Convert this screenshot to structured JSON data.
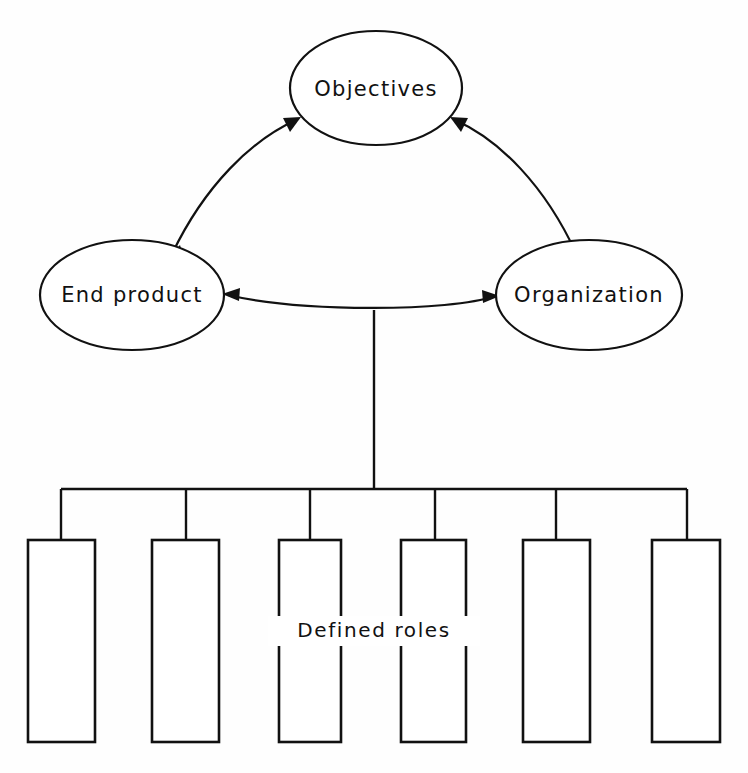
{
  "figure": {
    "caption": "",
    "background_color": "#fefefe",
    "line_color": "#111111"
  },
  "nodes": [
    {
      "id": "objectives",
      "label": "Objectives",
      "shape": "ellipse",
      "cx": 376,
      "cy": 88,
      "rx": 86,
      "ry": 57
    },
    {
      "id": "end-product",
      "label": "End product",
      "shape": "ellipse",
      "cx": 132,
      "cy": 295,
      "rx": 92,
      "ry": 55
    },
    {
      "id": "organization",
      "label": "Organization",
      "shape": "ellipse",
      "cx": 589,
      "cy": 295,
      "rx": 93,
      "ry": 55
    }
  ],
  "connectors": [
    {
      "id": "end-product-objectives",
      "from": "end product",
      "to": "objectives",
      "style": "curved",
      "arrowheads": "both"
    },
    {
      "id": "objectives-organization",
      "from": "objectives",
      "to": "organization",
      "style": "curved",
      "arrowheads": "both"
    },
    {
      "id": "end-product-organization",
      "from": "end product",
      "to": "organization",
      "style": "curved",
      "arrowheads": "both"
    },
    {
      "id": "stem",
      "from": "end-product-organization link",
      "to": "roles bar",
      "style": "straight",
      "arrowheads": "none"
    }
  ],
  "roles": {
    "label": "Defined   roles",
    "count": 6,
    "boxes": [
      {
        "index": 1,
        "x": 28,
        "y": 540,
        "width": 67,
        "height": 202
      },
      {
        "index": 2,
        "x": 152,
        "y": 540,
        "width": 67,
        "height": 202
      },
      {
        "index": 3,
        "x": 279,
        "y": 540,
        "width": 62,
        "height": 202
      },
      {
        "index": 4,
        "x": 401,
        "y": 540,
        "width": 65,
        "height": 202
      },
      {
        "index": 5,
        "x": 523,
        "y": 540,
        "width": 67,
        "height": 202
      },
      {
        "index": 6,
        "x": 652,
        "y": 540,
        "width": 68,
        "height": 202
      }
    ],
    "bar": {
      "x1": 61,
      "x2": 687,
      "y": 489
    },
    "drops": [
      61,
      186,
      310,
      435,
      556,
      687
    ]
  }
}
